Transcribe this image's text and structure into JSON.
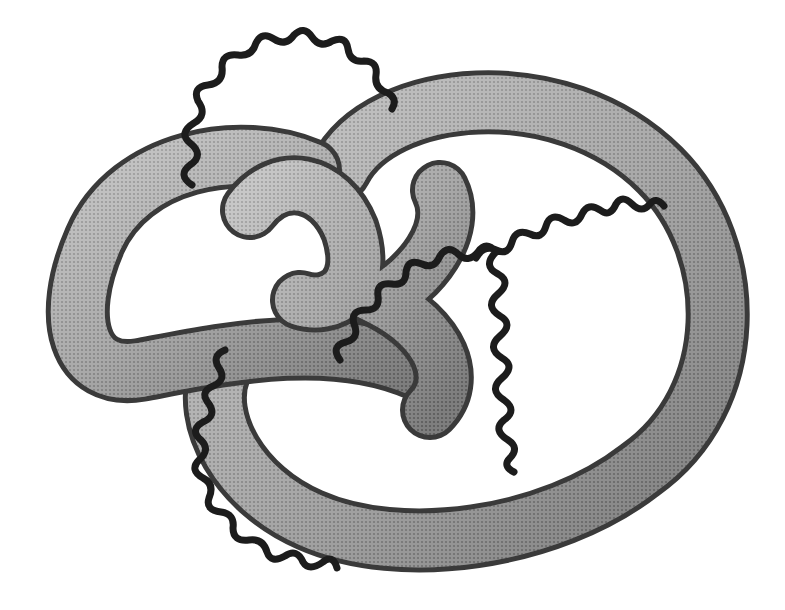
{
  "diagram": {
    "type": "knotted-tube-with-wavy-lines",
    "colors": {
      "background": "#ffffff",
      "tube_light": "#d8d8d8",
      "tube_mid": "#9a9a9a",
      "tube_dark": "#3a3a3a",
      "wavy_line": "#1c1c1c"
    },
    "elements": {
      "tube": {
        "label": ""
      },
      "wavy_lines": [
        {
          "id": "top-arc",
          "label": ""
        },
        {
          "id": "bottom-left-arc",
          "label": ""
        },
        {
          "id": "right-zigzag",
          "label": ""
        }
      ]
    }
  }
}
